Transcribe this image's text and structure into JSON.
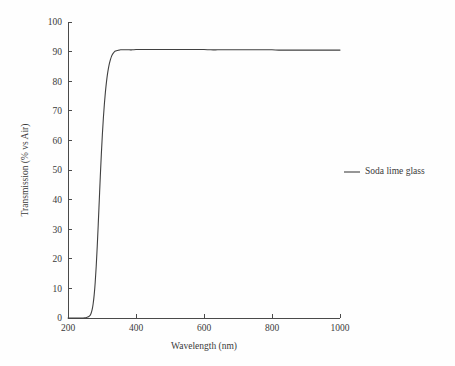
{
  "chart_data": {
    "type": "line",
    "title": "",
    "subtitle": "",
    "xlabel": "Wavelength (nm)",
    "ylabel": "Transmission (% vs Air)",
    "xlim": [
      200,
      1000
    ],
    "ylim": [
      0,
      100
    ],
    "xticks": [
      200,
      400,
      600,
      800,
      1000
    ],
    "yticks": [
      0,
      10,
      20,
      30,
      40,
      50,
      60,
      70,
      80,
      90,
      100
    ],
    "xtick_labels": [
      "200",
      "400",
      "600",
      "800",
      "1000"
    ],
    "ytick_labels": [
      "0",
      "10",
      "20",
      "30",
      "40",
      "50",
      "60",
      "70",
      "80",
      "90",
      "100"
    ],
    "grid": false,
    "legend_position": "right",
    "legend": [
      "Soda lime glass"
    ],
    "annotations": [],
    "series": [
      {
        "name": "Soda lime glass",
        "color": "#404040",
        "x": [
          200,
          210,
          220,
          230,
          240,
          250,
          255,
          260,
          265,
          268,
          271,
          274,
          277,
          280,
          283,
          286,
          289,
          292,
          295,
          298,
          301,
          304,
          307,
          310,
          313,
          316,
          319,
          322,
          325,
          328,
          331,
          334,
          337,
          340,
          345,
          350,
          355,
          360,
          365,
          370,
          380,
          390,
          400,
          420,
          440,
          460,
          480,
          500,
          520,
          540,
          560,
          580,
          600,
          620,
          640,
          660,
          680,
          700,
          720,
          740,
          760,
          780,
          800,
          820,
          840,
          860,
          880,
          900,
          920,
          940,
          960,
          980,
          1000
        ],
        "y": [
          0.0,
          0.0,
          0.0,
          0.0,
          0.0,
          0.1,
          0.2,
          0.4,
          0.9,
          1.6,
          2.8,
          4.8,
          7.8,
          12.0,
          17.5,
          24.2,
          31.8,
          39.8,
          47.8,
          55.2,
          61.8,
          67.5,
          72.3,
          76.3,
          79.6,
          82.3,
          84.4,
          86.1,
          87.4,
          88.4,
          89.1,
          89.6,
          90.0,
          90.2,
          90.4,
          90.5,
          90.6,
          90.6,
          90.6,
          90.6,
          90.6,
          90.6,
          90.7,
          90.7,
          90.7,
          90.7,
          90.7,
          90.7,
          90.7,
          90.7,
          90.7,
          90.7,
          90.7,
          90.6,
          90.6,
          90.6,
          90.6,
          90.6,
          90.6,
          90.6,
          90.6,
          90.6,
          90.6,
          90.5,
          90.5,
          90.5,
          90.5,
          90.5,
          90.5,
          90.5,
          90.5,
          90.5,
          90.5
        ]
      }
    ]
  },
  "legend_items": [
    {
      "label": "Soda lime glass",
      "color": "#404040"
    }
  ],
  "axes": {
    "x_title": "Wavelength (nm)",
    "y_title": "Transmission (% vs Air)"
  }
}
